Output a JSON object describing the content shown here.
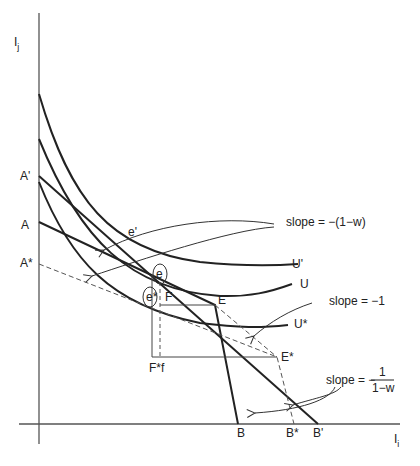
{
  "figure": {
    "axes": {
      "y_label": "I",
      "y_sub": "j",
      "x_label": "I",
      "x_sub": "i"
    },
    "intercepts_y": [
      "A'",
      "A",
      "A*"
    ],
    "intercepts_x": [
      "B",
      "B*",
      "B'"
    ],
    "curves": [
      {
        "name": "U'",
        "label": "U'"
      },
      {
        "name": "U",
        "label": "U"
      },
      {
        "name": "U*",
        "label": "U*"
      }
    ],
    "points": {
      "e_prime": "e'",
      "e": "e",
      "e_star": "e*",
      "E": "E",
      "E_star": "E*",
      "F": "F",
      "F_star_f": "F*f"
    },
    "annotations": {
      "slope1": "slope = −(1−w)",
      "slope2": "slope = −1",
      "slope3_prefix": "slope = −",
      "slope3_num": "1",
      "slope3_den": "1−w"
    }
  }
}
